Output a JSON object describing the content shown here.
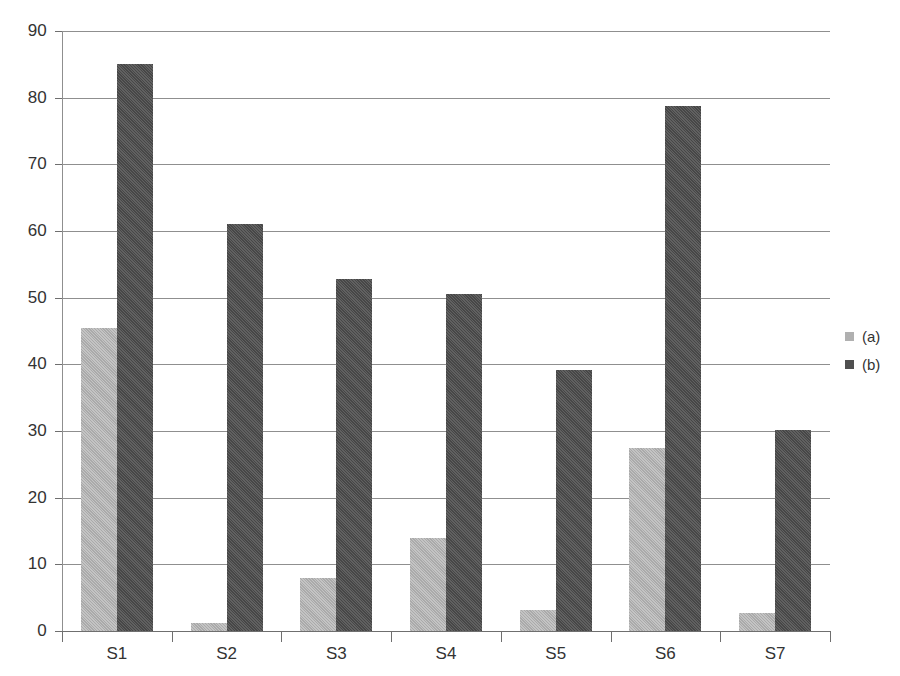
{
  "chart_data": {
    "type": "bar",
    "title": "",
    "subtitle": "",
    "xlabel": "",
    "ylabel": "",
    "categories": [
      "S1",
      "S2",
      "S3",
      "S4",
      "S5",
      "S6",
      "S7"
    ],
    "series": [
      {
        "name": "(a)",
        "color": "#b3b3b3",
        "values": [
          45.5,
          1.2,
          8.0,
          14.0,
          3.2,
          27.4,
          2.7
        ]
      },
      {
        "name": "(b)",
        "color": "#4f4f4f",
        "values": [
          85.0,
          61.0,
          52.8,
          50.5,
          39.2,
          78.8,
          30.2
        ]
      }
    ],
    "ylim": [
      0,
      90
    ],
    "ytick_step": 10,
    "yticks": [
      0,
      10,
      20,
      30,
      40,
      50,
      60,
      70,
      80,
      90
    ],
    "ytick_labels": [
      "0",
      "10",
      "20",
      "30",
      "40",
      "50",
      "60",
      "70",
      "80",
      "90"
    ],
    "grid": true,
    "grid_axis": "y",
    "legend_position": "right",
    "legend_entries": [
      "(a)",
      "(b)"
    ],
    "annotations": []
  }
}
